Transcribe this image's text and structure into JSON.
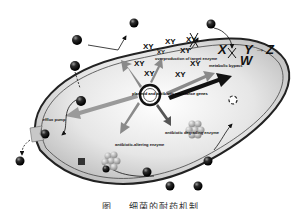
{
  "diagram": {
    "center_label": "plasmid and antibiotic resistance genes",
    "labels": {
      "overproduction": "overproduction of target enzyme",
      "metabolic_bypass": "metabolic bypass",
      "efflux_pump": "efflux pump",
      "altering_enzyme": "antibiotic-altering enzyme",
      "degrading_enzyme": "antibiotic degrading enzyme"
    },
    "xy_marks": [
      "XY",
      "XY",
      "XY",
      "XY",
      "XY",
      "XY",
      "XY",
      "XY",
      "XY"
    ],
    "pathway": {
      "x": "X",
      "y": "Y",
      "w": "W",
      "z": "Z"
    },
    "colors": {
      "cell_fill": "#d9d9d9",
      "membrane": "#222222",
      "arrow": "#8a8a8a",
      "antibiotic": "#1a1a1a"
    }
  },
  "caption": "图 … 细菌的耐药机制"
}
